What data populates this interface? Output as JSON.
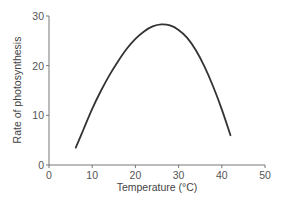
{
  "chart_data": {
    "type": "line",
    "title": "",
    "xlabel": "Temperature (°C)",
    "ylabel": "Rate of photosynthesis",
    "xlim": [
      0,
      50
    ],
    "ylim": [
      0,
      30
    ],
    "xticks": [
      0,
      10,
      20,
      30,
      40,
      50
    ],
    "yticks": [
      0,
      10,
      20,
      30
    ],
    "grid": false,
    "legend": null,
    "series": [
      {
        "name": "Rate of photosynthesis",
        "color": "#333333",
        "x": [
          6.2,
          8,
          10,
          12,
          14,
          16,
          18,
          20,
          22,
          24,
          26,
          28,
          30,
          32,
          34,
          36,
          38,
          40,
          42
        ],
        "y": [
          3.5,
          7.2,
          11.3,
          14.9,
          18.1,
          20.9,
          23.4,
          25.4,
          26.9,
          27.9,
          28.3,
          28.1,
          27.2,
          25.6,
          23.1,
          19.8,
          15.8,
          11.2,
          6.0
        ]
      }
    ]
  }
}
